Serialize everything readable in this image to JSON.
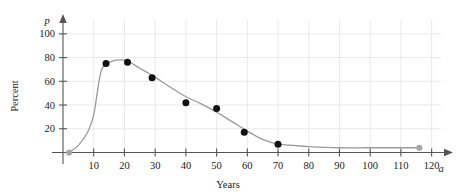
{
  "chart_data": {
    "type": "scatter",
    "title": "",
    "xlabel": "Years",
    "ylabel": "Percent",
    "x_axis_variable": "a",
    "y_axis_variable": "p",
    "xlim": [
      0,
      125
    ],
    "ylim": [
      0,
      110
    ],
    "xticks": [
      10,
      20,
      30,
      40,
      50,
      60,
      70,
      80,
      90,
      100,
      110,
      120
    ],
    "yticks": [
      20,
      40,
      60,
      80,
      100
    ],
    "grid": true,
    "legend": null,
    "series": [
      {
        "name": "data points",
        "marker": "filled-circle",
        "color": "#111111",
        "points": [
          {
            "x": 14,
            "y": 75
          },
          {
            "x": 21,
            "y": 76
          },
          {
            "x": 29,
            "y": 63
          },
          {
            "x": 40,
            "y": 42
          },
          {
            "x": 50,
            "y": 37
          },
          {
            "x": 59,
            "y": 17
          },
          {
            "x": 70,
            "y": 7
          }
        ]
      },
      {
        "name": "endpoint markers",
        "marker": "filled-circle",
        "color": "#a8a8a8",
        "points": [
          {
            "x": 2,
            "y": 0
          },
          {
            "x": 116,
            "y": 4
          }
        ]
      },
      {
        "name": "fitted curve",
        "marker": "none",
        "color": "#9a9a9a",
        "points": [
          {
            "x": 2,
            "y": 0
          },
          {
            "x": 5,
            "y": 6
          },
          {
            "x": 8,
            "y": 17
          },
          {
            "x": 10,
            "y": 32
          },
          {
            "x": 11,
            "y": 48
          },
          {
            "x": 12,
            "y": 64
          },
          {
            "x": 13,
            "y": 72
          },
          {
            "x": 15,
            "y": 76
          },
          {
            "x": 18,
            "y": 78
          },
          {
            "x": 21,
            "y": 77
          },
          {
            "x": 25,
            "y": 71
          },
          {
            "x": 29,
            "y": 65
          },
          {
            "x": 35,
            "y": 55
          },
          {
            "x": 40,
            "y": 47
          },
          {
            "x": 45,
            "y": 41
          },
          {
            "x": 50,
            "y": 34
          },
          {
            "x": 55,
            "y": 26
          },
          {
            "x": 60,
            "y": 18
          },
          {
            "x": 65,
            "y": 11
          },
          {
            "x": 70,
            "y": 7
          },
          {
            "x": 75,
            "y": 6
          },
          {
            "x": 80,
            "y": 5
          },
          {
            "x": 90,
            "y": 4
          },
          {
            "x": 100,
            "y": 4
          },
          {
            "x": 116,
            "y": 4
          }
        ]
      }
    ]
  },
  "axis": {
    "y_variable": "p",
    "x_variable": "a",
    "x_title": "Years",
    "y_title": "Percent",
    "y_tick_labels": [
      "100",
      "80",
      "60",
      "40",
      "20"
    ],
    "x_tick_labels": [
      "10",
      "20",
      "30",
      "40",
      "50",
      "60",
      "70",
      "80",
      "90",
      "100",
      "110",
      "120"
    ]
  },
  "colors": {
    "gridline": "#e6e6e6",
    "axis": "#555555",
    "curve": "#9a9a9a",
    "point": "#111111",
    "endpoint": "#a8a8a8",
    "text": "#1a1a1a"
  },
  "caption": ""
}
